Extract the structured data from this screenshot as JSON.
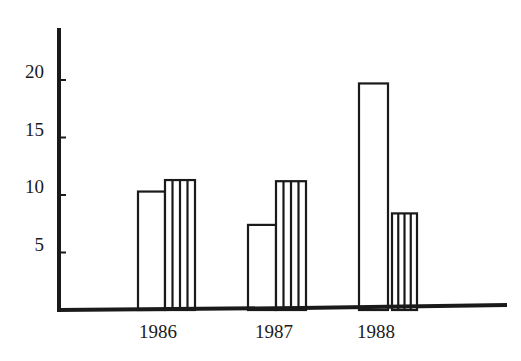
{
  "chart_data": {
    "type": "bar",
    "title": "",
    "xlabel": "",
    "ylabel": "",
    "categories": [
      "1986",
      "1987",
      "1988"
    ],
    "series": [
      {
        "name": "open",
        "pattern": "none",
        "values": [
          10.3,
          7.4,
          19.7
        ]
      },
      {
        "name": "striped",
        "pattern": "vertical-stripes",
        "values": [
          11.3,
          11.2,
          8.4
        ]
      }
    ],
    "yticks": [
      5,
      10,
      15,
      20
    ],
    "ytick_labels": [
      "5",
      "10",
      "15",
      "20"
    ],
    "ylim": [
      0,
      24
    ],
    "grid": false,
    "legend": null,
    "colors": {
      "ink": "#1a1a1a",
      "background": "#ffffff"
    }
  }
}
